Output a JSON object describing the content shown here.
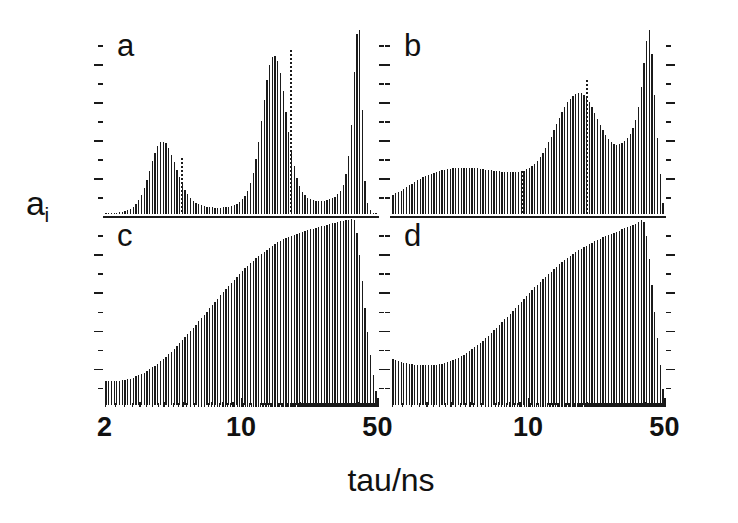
{
  "figure": {
    "ylabel_main": "a",
    "ylabel_sub": "i",
    "xlabel": "tau/ns",
    "background": "#ffffff",
    "ink": "#1b1b1b"
  },
  "axis": {
    "x_scale": "log",
    "x_min": 2,
    "x_max": 50,
    "x_unit": "ns",
    "x_ticklabels": [
      {
        "text": "2",
        "x_value": 2,
        "column": "left"
      },
      {
        "text": "10",
        "x_value": 10,
        "column": "left"
      },
      {
        "text": "50",
        "x_value": 50,
        "column": "left"
      },
      {
        "text": "10",
        "x_value": 10,
        "column": "right"
      },
      {
        "text": "50",
        "x_value": 50,
        "column": "right"
      }
    ],
    "x_major_ticks": [
      2,
      10,
      50
    ],
    "x_minor_ticks": [
      3,
      4,
      5,
      6,
      7,
      8,
      9,
      20,
      30,
      40
    ],
    "y_major_tick_count": 5,
    "y_minor_tick_count": 10,
    "y_ticklabels": []
  },
  "panels": [
    {
      "id": "a",
      "label": "a",
      "column": "left",
      "row": "top"
    },
    {
      "id": "b",
      "label": "b",
      "column": "right",
      "row": "top"
    },
    {
      "id": "c",
      "label": "c",
      "column": "left",
      "row": "bottom"
    },
    {
      "id": "d",
      "label": "d",
      "column": "right",
      "row": "bottom"
    }
  ],
  "chart_data": [
    {
      "id": "a",
      "type": "bar",
      "title": "a",
      "xlabel": "tau/ns",
      "ylabel": "a_i",
      "xscale": "log",
      "xlim": [
        2,
        50
      ],
      "ylim": [
        0,
        1
      ],
      "grid": false,
      "legend": "none",
      "n_bars": 100,
      "description": "Three-component lifetime distribution: broad peak near 5 ns, sharper peak near 18 ns, very narrow tall spike near 38 ns.",
      "markers": [
        {
          "x_value": 5.0,
          "height": 0.3,
          "style": "dotted"
        },
        {
          "x_value": 18.0,
          "height": 0.88,
          "style": "dotted"
        }
      ],
      "values": [
        0.004,
        0.005,
        0.006,
        0.007,
        0.009,
        0.011,
        0.014,
        0.018,
        0.023,
        0.03,
        0.04,
        0.055,
        0.075,
        0.103,
        0.14,
        0.185,
        0.235,
        0.285,
        0.33,
        0.365,
        0.385,
        0.39,
        0.38,
        0.355,
        0.32,
        0.28,
        0.238,
        0.198,
        0.162,
        0.132,
        0.107,
        0.088,
        0.073,
        0.062,
        0.054,
        0.048,
        0.044,
        0.041,
        0.039,
        0.038,
        0.037,
        0.037,
        0.037,
        0.038,
        0.039,
        0.041,
        0.044,
        0.049,
        0.056,
        0.066,
        0.08,
        0.1,
        0.128,
        0.168,
        0.222,
        0.295,
        0.39,
        0.5,
        0.615,
        0.72,
        0.8,
        0.845,
        0.85,
        0.82,
        0.755,
        0.66,
        0.55,
        0.44,
        0.34,
        0.258,
        0.196,
        0.152,
        0.122,
        0.102,
        0.089,
        0.081,
        0.076,
        0.073,
        0.072,
        0.072,
        0.073,
        0.076,
        0.08,
        0.086,
        0.095,
        0.108,
        0.128,
        0.16,
        0.215,
        0.315,
        0.48,
        0.76,
        0.965,
        0.985,
        0.56,
        0.18,
        0.06,
        0.022,
        0.01,
        0.006
      ]
    },
    {
      "id": "b",
      "type": "bar",
      "title": "b",
      "xlabel": "tau/ns",
      "ylabel": "a_i",
      "xscale": "log",
      "xlim": [
        2,
        50
      ],
      "ylim": [
        0,
        1
      ],
      "grid": false,
      "legend": "none",
      "n_bars": 100,
      "description": "Broad continuous distribution rising from low tau, shallow plateau near 7-10 ns, broad hump near 20 ns, dip, then tall sharp peak near 38 ns.",
      "markers": [
        {
          "x_value": 9.5,
          "height": 0.23,
          "style": "dotted"
        },
        {
          "x_value": 20.0,
          "height": 0.72,
          "style": "dotted"
        }
      ],
      "values": [
        0.105,
        0.112,
        0.12,
        0.128,
        0.137,
        0.146,
        0.155,
        0.164,
        0.173,
        0.182,
        0.19,
        0.198,
        0.205,
        0.212,
        0.218,
        0.223,
        0.228,
        0.232,
        0.236,
        0.239,
        0.242,
        0.244,
        0.246,
        0.247,
        0.248,
        0.249,
        0.249,
        0.249,
        0.249,
        0.248,
        0.247,
        0.246,
        0.244,
        0.242,
        0.24,
        0.238,
        0.236,
        0.234,
        0.232,
        0.23,
        0.228,
        0.227,
        0.226,
        0.225,
        0.225,
        0.226,
        0.228,
        0.231,
        0.235,
        0.241,
        0.249,
        0.259,
        0.272,
        0.288,
        0.307,
        0.33,
        0.356,
        0.385,
        0.417,
        0.45,
        0.484,
        0.517,
        0.548,
        0.576,
        0.6,
        0.62,
        0.635,
        0.645,
        0.65,
        0.648,
        0.64,
        0.625,
        0.603,
        0.576,
        0.545,
        0.512,
        0.48,
        0.45,
        0.424,
        0.403,
        0.388,
        0.378,
        0.374,
        0.375,
        0.381,
        0.392,
        0.408,
        0.43,
        0.46,
        0.505,
        0.575,
        0.68,
        0.81,
        0.93,
        0.985,
        0.86,
        0.64,
        0.41,
        0.215,
        0.06
      ]
    },
    {
      "id": "c",
      "type": "bar",
      "title": "c",
      "xlabel": "tau/ns",
      "ylabel": "a_i",
      "xscale": "log",
      "xlim": [
        2,
        50
      ],
      "ylim": [
        0,
        1
      ],
      "grid": false,
      "legend": "none",
      "n_bars": 100,
      "description": "Smooth monotonic rise from a low flat shoulder near 2 ns to a broad maximum near 35 ns, then a steep drop to the right edge.",
      "markers": [],
      "values": [
        0.13,
        0.129,
        0.129,
        0.129,
        0.13,
        0.131,
        0.133,
        0.136,
        0.139,
        0.143,
        0.148,
        0.154,
        0.16,
        0.167,
        0.175,
        0.183,
        0.192,
        0.202,
        0.212,
        0.223,
        0.235,
        0.247,
        0.26,
        0.273,
        0.287,
        0.301,
        0.316,
        0.331,
        0.347,
        0.363,
        0.379,
        0.396,
        0.413,
        0.43,
        0.447,
        0.464,
        0.482,
        0.499,
        0.517,
        0.534,
        0.552,
        0.569,
        0.586,
        0.603,
        0.62,
        0.637,
        0.653,
        0.669,
        0.685,
        0.7,
        0.715,
        0.73,
        0.744,
        0.758,
        0.771,
        0.784,
        0.796,
        0.808,
        0.819,
        0.83,
        0.84,
        0.85,
        0.859,
        0.868,
        0.876,
        0.884,
        0.891,
        0.898,
        0.904,
        0.91,
        0.915,
        0.92,
        0.925,
        0.929,
        0.933,
        0.937,
        0.941,
        0.945,
        0.949,
        0.953,
        0.957,
        0.961,
        0.965,
        0.969,
        0.973,
        0.977,
        0.981,
        0.984,
        0.987,
        0.989,
        0.99,
        0.986,
        0.92,
        0.8,
        0.66,
        0.52,
        0.39,
        0.27,
        0.16,
        0.075
      ]
    },
    {
      "id": "d",
      "type": "bar",
      "title": "d",
      "xlabel": "tau/ns",
      "ylabel": "a_i",
      "xscale": "log",
      "xlim": [
        2,
        50
      ],
      "ylim": [
        0,
        1
      ],
      "grid": false,
      "legend": "none",
      "n_bars": 100,
      "description": "Shallow U-shaped start with a minimum near 4 ns, then a smooth rise to a broad maximum near 35 ns followed by a steep fall at the right edge.",
      "markers": [],
      "values": [
        0.245,
        0.24,
        0.235,
        0.231,
        0.227,
        0.224,
        0.221,
        0.219,
        0.217,
        0.215,
        0.214,
        0.213,
        0.213,
        0.213,
        0.214,
        0.215,
        0.217,
        0.219,
        0.222,
        0.226,
        0.23,
        0.235,
        0.241,
        0.247,
        0.254,
        0.262,
        0.27,
        0.279,
        0.289,
        0.299,
        0.31,
        0.321,
        0.333,
        0.345,
        0.358,
        0.371,
        0.385,
        0.399,
        0.413,
        0.428,
        0.443,
        0.458,
        0.473,
        0.489,
        0.504,
        0.52,
        0.536,
        0.551,
        0.567,
        0.583,
        0.598,
        0.613,
        0.628,
        0.643,
        0.658,
        0.672,
        0.686,
        0.7,
        0.713,
        0.726,
        0.739,
        0.751,
        0.763,
        0.774,
        0.785,
        0.796,
        0.806,
        0.816,
        0.825,
        0.834,
        0.843,
        0.851,
        0.859,
        0.867,
        0.874,
        0.881,
        0.888,
        0.895,
        0.901,
        0.907,
        0.913,
        0.919,
        0.925,
        0.931,
        0.937,
        0.943,
        0.949,
        0.955,
        0.961,
        0.967,
        0.975,
        0.985,
        0.975,
        0.9,
        0.78,
        0.64,
        0.5,
        0.36,
        0.215,
        0.09
      ]
    }
  ]
}
